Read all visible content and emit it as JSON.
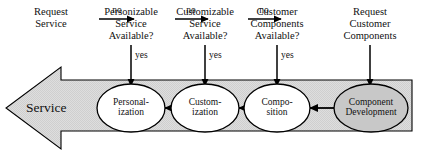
{
  "diagram": {
    "type": "flowchart",
    "colors": {
      "band_fill": "#dcdcdc",
      "node_fill_default": "#ffffff",
      "node_fill_highlight": "#c8c8c8",
      "stroke": "#000000",
      "text": "#111111"
    },
    "top_nodes": [
      {
        "id": "request-service",
        "lines": [
          "Request",
          "Service"
        ]
      },
      {
        "id": "personizable-service-available",
        "lines": [
          "Personizable",
          "Service",
          "Available?"
        ]
      },
      {
        "id": "customizable-service-available",
        "lines": [
          "Customizable",
          "Service",
          "Available?"
        ]
      },
      {
        "id": "customer-components-available",
        "lines": [
          "Customer",
          "Components",
          "Available?"
        ]
      },
      {
        "id": "request-customer-components",
        "lines": [
          "Request",
          "Customer",
          "Components"
        ]
      }
    ],
    "horizontal_edge_labels": [
      "no",
      "no",
      "no"
    ],
    "vertical_edge_labels": [
      "yes",
      "yes",
      "yes"
    ],
    "process_nodes": [
      {
        "id": "personalization",
        "lines": [
          "Personal-",
          "ization"
        ],
        "fill": "white"
      },
      {
        "id": "customization",
        "lines": [
          "Custom-",
          "ization"
        ],
        "fill": "white"
      },
      {
        "id": "composition",
        "lines": [
          "Compo-",
          "sition"
        ],
        "fill": "white"
      },
      {
        "id": "component-development",
        "lines": [
          "Component",
          "Development"
        ],
        "fill": "gray"
      }
    ],
    "output_label": "Service"
  }
}
